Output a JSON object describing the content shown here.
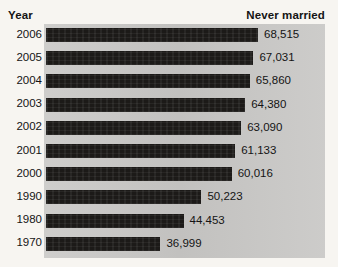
{
  "header": {
    "year_label": "Year",
    "value_label": "Never married"
  },
  "colors": {
    "page_background": "#f7f5f1",
    "plot_background": "#c9c8c6",
    "bar_fill": "#1c1a18",
    "text": "#141414"
  },
  "chart_data": {
    "type": "bar",
    "orientation": "horizontal",
    "title": "",
    "xlabel": "Never married",
    "ylabel": "Year",
    "grid": false,
    "legend": "none",
    "xlim": [
      0,
      70000
    ],
    "categories": [
      "2006",
      "2005",
      "2004",
      "2003",
      "2002",
      "2001",
      "2000",
      "1990",
      "1980",
      "1970"
    ],
    "values": [
      68515,
      67031,
      65860,
      64380,
      63090,
      61133,
      60016,
      50223,
      44453,
      36999
    ],
    "value_labels": [
      "68,515",
      "67,031",
      "65,860",
      "64,380",
      "63,090",
      "61,133",
      "60,016",
      "50,223",
      "44,453",
      "36,999"
    ]
  }
}
